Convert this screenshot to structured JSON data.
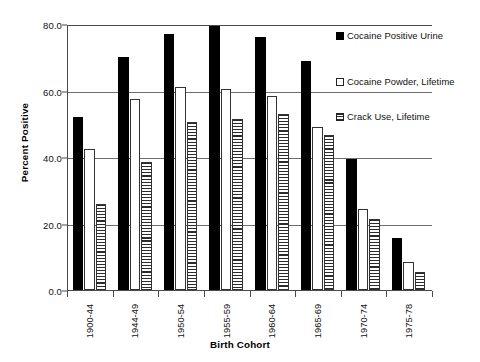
{
  "chart_data": {
    "type": "bar",
    "title": "",
    "xlabel": "Birth Cohort",
    "ylabel": "Percent Positive",
    "categories": [
      "1900-44",
      "1944-49",
      "1950-54",
      "1955-59",
      "1960-64",
      "1965-69",
      "1970-74",
      "1975-78"
    ],
    "series": [
      {
        "name": "Cocaine Positive Urine",
        "marker": "filled-black-square",
        "values": [
          52.0,
          70.0,
          77.0,
          79.5,
          76.0,
          69.0,
          39.5,
          15.5
        ]
      },
      {
        "name": "Cocaine Powder, Lifetime",
        "marker": "open-white-square",
        "values": [
          42.5,
          57.5,
          61.0,
          60.5,
          58.5,
          49.0,
          24.5,
          8.5
        ]
      },
      {
        "name": "Crack Use, Lifetime",
        "marker": "hatched-square",
        "values": [
          26.0,
          38.5,
          50.5,
          51.5,
          53.0,
          46.5,
          21.5,
          5.5
        ]
      }
    ],
    "ylim": [
      0.0,
      80.0
    ],
    "ytick_labels": [
      "0.0",
      "20.0",
      "40.0",
      "60.0",
      "80.0"
    ],
    "ytick_values": [
      0.0,
      20.0,
      40.0,
      60.0,
      80.0
    ],
    "grid": "horizontal",
    "legend_position": "right-top",
    "colors": {
      "urine": "#000000",
      "powder": "#ffffff",
      "crack": "#2b2b2b",
      "axis": "#4a4a4a",
      "grid": "#6f6f6f"
    }
  }
}
